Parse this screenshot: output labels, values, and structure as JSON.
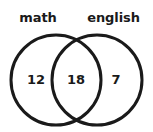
{
  "figure": {
    "type": "venn-diagram",
    "background_color": "#ffffff",
    "stroke_color": "#1a1a1a",
    "text_color": "#1a1a1a",
    "stroke_width": 3
  },
  "sets": {
    "left": {
      "label": "math",
      "only_count": "12",
      "circle": {
        "cx": 56,
        "cy": 80,
        "r": 45
      }
    },
    "right": {
      "label": "english",
      "only_count": "7",
      "circle": {
        "cx": 97,
        "cy": 80,
        "r": 45
      }
    }
  },
  "intersection": {
    "label": "",
    "count": "18"
  },
  "chart_data": {
    "type": "venn",
    "title": "",
    "categories": [
      "math",
      "english"
    ],
    "regions": [
      {
        "name": "math only",
        "label": "12",
        "value": 12
      },
      {
        "name": "math and english",
        "label": "18",
        "value": 18
      },
      {
        "name": "english only",
        "label": "7",
        "value": 7
      }
    ],
    "set_totals": [
      {
        "name": "math",
        "value": 30
      },
      {
        "name": "english",
        "value": 25
      }
    ],
    "total": 37,
    "legend": "none",
    "grid": false
  }
}
